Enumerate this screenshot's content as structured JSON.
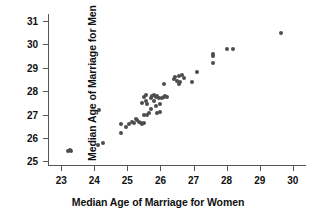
{
  "chart_data": {
    "type": "scatter",
    "title": "",
    "xlabel": "Median Age of Marriage for Women",
    "ylabel": "Median Age of Marriage for Men",
    "xlim": [
      22.6,
      30.4
    ],
    "ylim": [
      24.8,
      31.3
    ],
    "xticks": [
      23,
      24,
      25,
      26,
      27,
      28,
      29,
      30
    ],
    "yticks": [
      25,
      26,
      27,
      28,
      29,
      30,
      31
    ],
    "xtick_labels": [
      "23",
      "24",
      "25",
      "26",
      "27",
      "28",
      "29",
      "30"
    ],
    "ytick_labels": [
      "25",
      "26",
      "27",
      "28",
      "29",
      "30",
      "31"
    ],
    "grid": false,
    "legend": null,
    "marker_color": "#4d4d4d",
    "axis_color": "#555555",
    "points": [
      {
        "x": 23.2,
        "y": 25.45
      },
      {
        "x": 23.25,
        "y": 25.5
      },
      {
        "x": 23.3,
        "y": 25.45
      },
      {
        "x": 24.1,
        "y": 25.7
      },
      {
        "x": 24.25,
        "y": 25.8
      },
      {
        "x": 24.15,
        "y": 27.2
      },
      {
        "x": 24.8,
        "y": 26.2
      },
      {
        "x": 24.8,
        "y": 26.6
      },
      {
        "x": 24.95,
        "y": 26.45
      },
      {
        "x": 25.05,
        "y": 26.6
      },
      {
        "x": 25.15,
        "y": 26.7
      },
      {
        "x": 25.2,
        "y": 26.65
      },
      {
        "x": 25.25,
        "y": 26.8
      },
      {
        "x": 25.3,
        "y": 26.75
      },
      {
        "x": 25.35,
        "y": 26.7
      },
      {
        "x": 25.4,
        "y": 26.65
      },
      {
        "x": 25.45,
        "y": 26.6
      },
      {
        "x": 25.5,
        "y": 26.65
      },
      {
        "x": 25.5,
        "y": 27.0
      },
      {
        "x": 25.45,
        "y": 27.5
      },
      {
        "x": 25.5,
        "y": 27.75
      },
      {
        "x": 25.55,
        "y": 27.85
      },
      {
        "x": 25.55,
        "y": 27.6
      },
      {
        "x": 25.6,
        "y": 27.45
      },
      {
        "x": 25.6,
        "y": 27.0
      },
      {
        "x": 25.65,
        "y": 27.05
      },
      {
        "x": 25.7,
        "y": 27.25
      },
      {
        "x": 25.7,
        "y": 27.7
      },
      {
        "x": 25.75,
        "y": 27.8
      },
      {
        "x": 25.8,
        "y": 27.85
      },
      {
        "x": 25.8,
        "y": 27.6
      },
      {
        "x": 25.85,
        "y": 27.75
      },
      {
        "x": 25.85,
        "y": 27.35
      },
      {
        "x": 25.9,
        "y": 27.8
      },
      {
        "x": 25.9,
        "y": 27.05
      },
      {
        "x": 25.95,
        "y": 27.7
      },
      {
        "x": 26.0,
        "y": 27.45
      },
      {
        "x": 26.05,
        "y": 27.7
      },
      {
        "x": 26.1,
        "y": 27.75
      },
      {
        "x": 26.15,
        "y": 27.8
      },
      {
        "x": 26.2,
        "y": 27.75
      },
      {
        "x": 26.1,
        "y": 28.3
      },
      {
        "x": 26.0,
        "y": 27.1
      },
      {
        "x": 26.4,
        "y": 28.5
      },
      {
        "x": 26.45,
        "y": 28.6
      },
      {
        "x": 26.5,
        "y": 28.45
      },
      {
        "x": 26.55,
        "y": 28.3
      },
      {
        "x": 26.55,
        "y": 28.65
      },
      {
        "x": 26.6,
        "y": 28.4
      },
      {
        "x": 26.65,
        "y": 28.7
      },
      {
        "x": 26.7,
        "y": 28.55
      },
      {
        "x": 26.95,
        "y": 28.4
      },
      {
        "x": 27.1,
        "y": 28.8
      },
      {
        "x": 27.6,
        "y": 29.2
      },
      {
        "x": 27.6,
        "y": 29.5
      },
      {
        "x": 27.6,
        "y": 29.6
      },
      {
        "x": 28.0,
        "y": 29.8
      },
      {
        "x": 28.2,
        "y": 29.8
      },
      {
        "x": 29.65,
        "y": 30.5
      }
    ]
  }
}
